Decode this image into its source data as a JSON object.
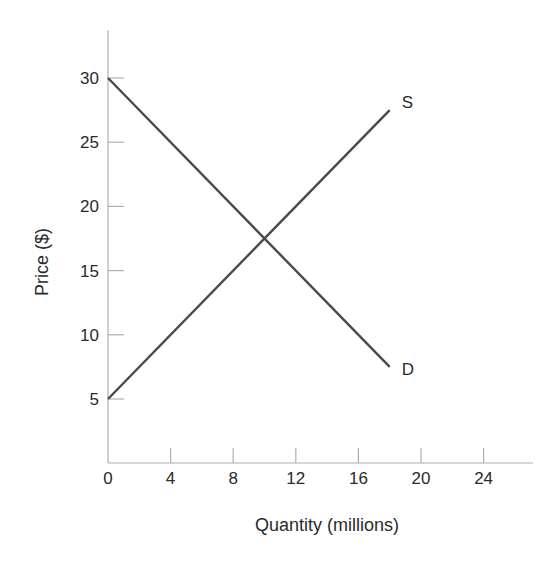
{
  "chart_data": {
    "type": "line",
    "title": "",
    "xlabel": "Quantity (millions)",
    "ylabel": "Price ($)",
    "xlim": [
      0,
      27
    ],
    "ylim": [
      0,
      33
    ],
    "x_ticks": [
      0,
      4,
      8,
      12,
      16,
      20,
      24
    ],
    "y_ticks": [
      5,
      10,
      15,
      20,
      25,
      30
    ],
    "grid": false,
    "legend": "inline labels at line ends",
    "series": [
      {
        "name": "S",
        "label": "S",
        "x": [
          0,
          18
        ],
        "y": [
          5,
          27.5
        ]
      },
      {
        "name": "D",
        "label": "D",
        "x": [
          0,
          18
        ],
        "y": [
          30,
          7.5
        ]
      }
    ],
    "equilibrium": {
      "x": 10,
      "y": 17.5
    }
  },
  "colors": {
    "line": "#4a4a4a",
    "axis": "#b0b0b0",
    "text": "#2a2a2a"
  }
}
